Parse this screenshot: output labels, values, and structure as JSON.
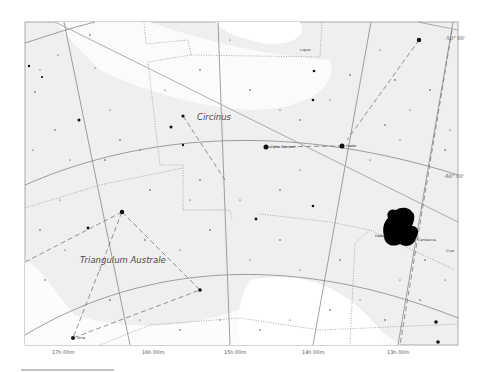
{
  "map": {
    "constellations": [
      {
        "name": "Circinus",
        "x": 197,
        "y": 112
      },
      {
        "name": "Triangulum Australe",
        "x": 80,
        "y": 255
      },
      {
        "name": "Lupus",
        "x": 302,
        "y": 48
      },
      {
        "name": "Centaurus",
        "x": 416,
        "y": 238
      },
      {
        "name": "Crux",
        "x": 446,
        "y": 249
      }
    ],
    "stars_named": [
      {
        "name": "Alpha Centauri",
        "x": 268,
        "y": 147
      },
      {
        "name": "Hadar",
        "x": 345,
        "y": 146
      },
      {
        "name": "Atria",
        "x": 75,
        "y": 338
      },
      {
        "name": "Hadar",
        "x": 381,
        "y": 236
      }
    ],
    "ra_labels": [
      "17h 00m",
      "16h 00m",
      "15h 00m",
      "14h 00m",
      "13h 00m"
    ],
    "dec_labels": [
      "-50° 00'",
      "-60° 00'"
    ],
    "colors": {
      "background": "#f2f2f2",
      "milky_way": "#ffffff",
      "grid_line": "#888888",
      "boundary": "#888888",
      "star": "#111111",
      "frame": "#aaaaaa"
    }
  }
}
